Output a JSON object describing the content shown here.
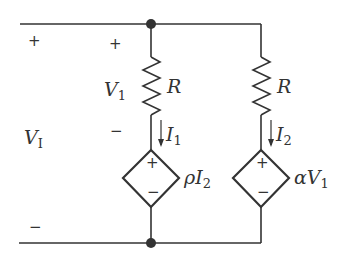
{
  "diagram": {
    "type": "circuit-schematic",
    "colors": {
      "wire": "#333333",
      "background": "#ffffff"
    },
    "port": {
      "label_main": "V",
      "label_sub": "I",
      "plus": "+",
      "minus": "−"
    },
    "branch1": {
      "resistor": {
        "label": "R"
      },
      "voltage": {
        "label_main": "V",
        "label_sub": "1",
        "plus": "+",
        "minus": "−"
      },
      "current": {
        "label_main": "I",
        "label_sub": "1"
      },
      "source": {
        "label_prefix": "ρI",
        "label_sub": "2",
        "plus": "+",
        "minus": "−"
      }
    },
    "branch2": {
      "resistor": {
        "label": "R"
      },
      "current": {
        "label_main": "I",
        "label_sub": "2"
      },
      "source": {
        "label_prefix": "αV",
        "label_sub": "1",
        "plus": "+",
        "minus": "−"
      }
    }
  }
}
